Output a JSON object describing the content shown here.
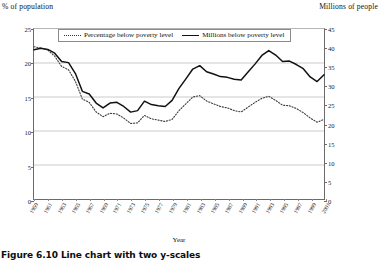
{
  "chart_data": {
    "type": "line",
    "title": "",
    "caption": "Figure 6.10  Line chart with two y-scales",
    "xlabel": "Year",
    "ylabel_left": "% of population",
    "ylabel_right": "Millions of people",
    "ylim_left": [
      0,
      25
    ],
    "ylim_right": [
      0,
      45
    ],
    "yticks_left": [
      0,
      5,
      10,
      15,
      20,
      25
    ],
    "yticks_right": [
      0,
      5,
      10,
      15,
      20,
      25,
      30,
      35,
      40,
      45
    ],
    "grid": true,
    "legend_position": "top-center",
    "x": [
      1959,
      1960,
      1961,
      1962,
      1963,
      1964,
      1965,
      1966,
      1967,
      1968,
      1969,
      1970,
      1971,
      1972,
      1973,
      1974,
      1975,
      1976,
      1977,
      1978,
      1979,
      1980,
      1981,
      1982,
      1983,
      1984,
      1985,
      1986,
      1987,
      1988,
      1989,
      1990,
      1991,
      1992,
      1993,
      1994,
      1995,
      1996,
      1997,
      1998,
      1999,
      2000,
      2001
    ],
    "xtick_labels": [
      "1959",
      "1961",
      "1963",
      "1965",
      "1967",
      "1969",
      "1971",
      "1973",
      "1975",
      "1977",
      "1979",
      "1981",
      "1983",
      "1985",
      "1987",
      "1989",
      "1991",
      "1993",
      "1995",
      "1997",
      "1999",
      "2001"
    ],
    "series": [
      {
        "name": "Percentage below poverty level",
        "style": "dotted",
        "axis": "left",
        "unit": "%",
        "values": [
          22.4,
          22.2,
          21.9,
          21.0,
          19.5,
          19.0,
          17.3,
          14.7,
          14.2,
          12.8,
          12.1,
          12.6,
          12.5,
          11.9,
          11.1,
          11.2,
          12.3,
          11.8,
          11.6,
          11.4,
          11.7,
          13.0,
          14.0,
          15.0,
          15.2,
          14.4,
          14.0,
          13.6,
          13.4,
          13.0,
          12.8,
          13.5,
          14.2,
          14.8,
          15.1,
          14.5,
          13.8,
          13.7,
          13.3,
          12.7,
          11.9,
          11.3,
          11.7
        ]
      },
      {
        "name": "Millions below poverty level",
        "style": "solid",
        "axis": "right",
        "unit": "millions",
        "values": [
          39.5,
          39.9,
          39.6,
          38.6,
          36.4,
          36.1,
          33.2,
          28.5,
          27.8,
          25.4,
          24.1,
          25.4,
          25.6,
          24.5,
          23.0,
          23.4,
          25.9,
          25.0,
          24.7,
          24.5,
          26.1,
          29.3,
          31.8,
          34.4,
          35.3,
          33.7,
          33.1,
          32.4,
          32.2,
          31.7,
          31.5,
          33.6,
          35.7,
          38.0,
          39.3,
          38.1,
          36.4,
          36.5,
          35.6,
          34.5,
          32.3,
          31.1,
          32.9
        ]
      }
    ]
  }
}
